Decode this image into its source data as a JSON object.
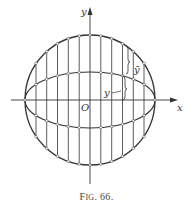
{
  "figure": {
    "caption_prefix": "F",
    "caption_smallcaps": "IG",
    "caption_number": ". 66."
  },
  "labels": {
    "x_axis": "x",
    "y_axis": "y",
    "origin": "O",
    "inner_height": "y",
    "outer_height": "ȳ"
  },
  "colors": {
    "ink": "#333333",
    "background": "#ffffff"
  },
  "geometry": {
    "center": [
      90,
      100
    ],
    "circle_radius": 65,
    "ellipse_semi_minor": 28,
    "vertical_divisions": 12
  }
}
